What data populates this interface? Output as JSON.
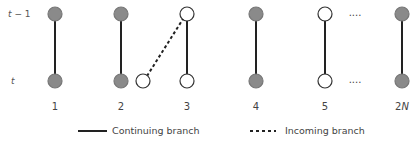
{
  "rows": {
    "top": {
      "label_pre": "t",
      "label_post": " − 1",
      "y": 14
    },
    "bottom": {
      "label": "t",
      "y": 81
    }
  },
  "colors": {
    "filled": "#8a8a8a",
    "empty": "#ffffff",
    "stroke": "#333333",
    "line": "#222222"
  },
  "columns": [
    {
      "label": "1",
      "x": 55,
      "top": "filled",
      "bottom": "filled"
    },
    {
      "label": "2",
      "x": 121,
      "top": "filled",
      "bottom": "filled"
    },
    {
      "label": "3",
      "x": 187,
      "top": "empty",
      "bottom": "empty"
    },
    {
      "label": "4",
      "x": 256,
      "top": "filled",
      "bottom": "filled"
    },
    {
      "label": "5",
      "x": 325,
      "top": "empty",
      "bottom": "empty"
    },
    {
      "label": "2N",
      "x": 402,
      "top": "filled",
      "bottom": "filled"
    }
  ],
  "incoming_node": {
    "x": 143,
    "y": 81,
    "fill": "empty"
  },
  "ellipsis": {
    "text": "....",
    "x": 355
  },
  "legend": {
    "continuing": "Continuing branch",
    "incoming": "Incoming branch"
  }
}
